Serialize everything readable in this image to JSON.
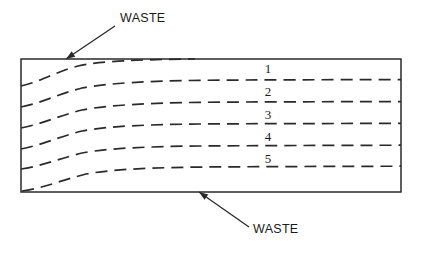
{
  "figure": {
    "background_color": "#ffffff",
    "line_color": "#2a2a2a"
  },
  "slab": {
    "name": "slab-rectangle",
    "x": 21,
    "y": 59,
    "width": 380,
    "height": 133
  },
  "annotations": [
    {
      "id": "waste-top",
      "label": "WASTE",
      "text_x": 120,
      "text_y": 22,
      "leader_start_x": 115,
      "leader_start_y": 26,
      "leader_end_x": 66,
      "leader_end_y": 59,
      "arrow_direction": "down-left"
    },
    {
      "id": "waste-bottom",
      "label": "WASTE",
      "text_x": 253,
      "text_y": 233,
      "leader_start_x": 249,
      "leader_start_y": 227,
      "leader_end_x": 199,
      "leader_end_y": 192,
      "arrow_direction": "up-left"
    }
  ],
  "zone_labels": [
    {
      "text": "1",
      "x": 268,
      "y": 73
    },
    {
      "text": "2",
      "x": 268,
      "y": 96
    },
    {
      "text": "3",
      "x": 268,
      "y": 119
    },
    {
      "text": "4",
      "x": 268,
      "y": 141
    },
    {
      "text": "5",
      "x": 268,
      "y": 163
    }
  ],
  "flow_lines": [
    {
      "id": "flow-line-0",
      "left_y": 59,
      "right_y": 59,
      "path": "M 21 86 C 40 82 55 72 78 66 C 100 61 140 59.5 195 59"
    },
    {
      "id": "flow-line-1",
      "left_y": 79,
      "right_y": 80,
      "path": "M 21 107 C 42 103 58 94 82 88 C 108 83 150 81 200 80.3 C 260 79.8 330 79.7 401 79.6"
    },
    {
      "id": "flow-line-2",
      "left_y": 101,
      "right_y": 102,
      "path": "M 21 128 C 42 124 58 116 82 110 C 108 105 150 103 200 102.3 C 260 101.8 330 101.7 401 101.6"
    },
    {
      "id": "flow-line-3",
      "left_y": 123,
      "right_y": 124,
      "path": "M 21 149 C 42 145 58 137 82 131 C 108 126 150 124.5 200 124 C 260 123.6 330 123.5 401 123.4"
    },
    {
      "id": "flow-line-4",
      "left_y": 147,
      "right_y": 145,
      "path": "M 21 169 C 42 166 58 159 82 153 C 108 148 150 146.5 200 146 C 260 145.6 330 145.4 401 145.2"
    },
    {
      "id": "flow-line-5",
      "left_y": 192,
      "right_y": 166,
      "path": "M 22 191 C 44 188 62 180 86 174 C 114 169 155 167.5 205 167 C 268 166.6 335 166.4 401 166.2"
    }
  ]
}
